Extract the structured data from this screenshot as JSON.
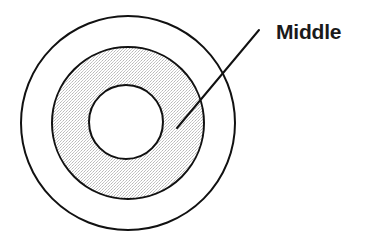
{
  "figure": {
    "type": "concentric-circle-diagram",
    "background_color": "#ffffff",
    "stroke_color": "#111111",
    "shading_color": "#e6e6e6",
    "label_color": "#1a1a1a",
    "canvas": {
      "width": 366,
      "height": 247
    }
  },
  "shapes": {
    "outer_circle": {
      "name": "outer-circle",
      "center_x": 128,
      "center_y": 123,
      "radius": 107,
      "fill": "#ffffff",
      "stroke": "#111111",
      "stroke_width": 2
    },
    "middle_ring": {
      "name": "middle-ring",
      "center_x": 128,
      "center_y": 123,
      "radius": 76,
      "fill": "#e6e6e6",
      "stroke": "#111111",
      "stroke_width": 2
    },
    "inner_circle": {
      "name": "inner-circle",
      "center_x": 126,
      "center_y": 122,
      "radius": 37,
      "fill": "#ffffff",
      "stroke": "#111111",
      "stroke_width": 2
    }
  },
  "leader_line": {
    "name": "leader-line",
    "x1": 259,
    "y1": 30,
    "x2": 177,
    "y2": 128,
    "stroke": "#111111",
    "stroke_width": 2
  },
  "annotation": {
    "label": "Middle",
    "x": 276,
    "y": 20,
    "font_size": 21
  }
}
